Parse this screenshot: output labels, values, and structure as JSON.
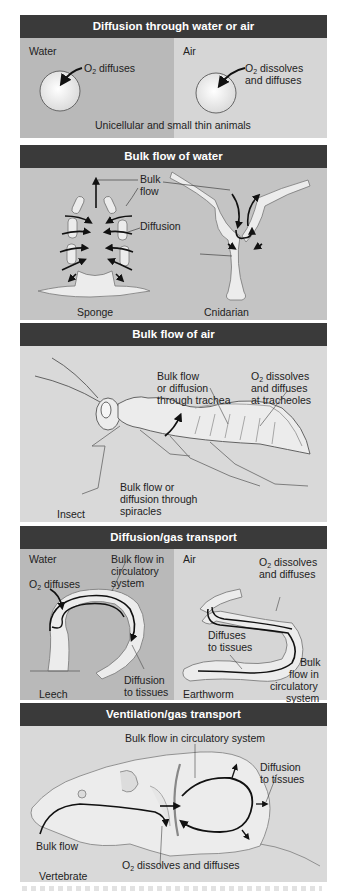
{
  "figure": {
    "panels": [
      {
        "title": "Diffusion through water or air",
        "left_label": "Water",
        "right_label": "Air",
        "left_annotation": {
          "prefix": "O",
          "sub": "2",
          "suffix": " diffuses"
        },
        "right_annotation": {
          "prefix": "O",
          "sub": "2",
          "line1_suffix": " dissolves",
          "line2": "and diffuses"
        },
        "caption": "Unicellular and small thin animals"
      },
      {
        "title": "Bulk flow of water",
        "labels": {
          "bulk_flow_1": "Bulk",
          "bulk_flow_2": "flow",
          "diffusion": "Diffusion"
        },
        "organisms": [
          "Sponge",
          "Cnidarian"
        ]
      },
      {
        "title": "Bulk flow of air",
        "labels": {
          "trachea": [
            "Bulk flow",
            "or diffusion",
            "through trachea"
          ],
          "tracheoles": {
            "prefix": "O",
            "sub": "2",
            "line1_suffix": " dissolves",
            "line2": "and diffuses",
            "line3": "at tracheoles"
          },
          "spiracles": [
            "Bulk flow or",
            "diffusion through",
            "spiracles"
          ]
        },
        "organism": "Insect"
      },
      {
        "title": "Diffusion/gas transport",
        "left_label": "Water",
        "right_label": "Air",
        "left_labels": {
          "o2": {
            "prefix": "O",
            "sub": "2",
            "suffix": " diffuses"
          },
          "bulk": [
            "Bulk flow in",
            "circulatory",
            "system"
          ],
          "diffusion": [
            "Diffusion",
            "to tissues"
          ]
        },
        "right_labels": {
          "o2": {
            "prefix": "O",
            "sub": "2",
            "line1_suffix": " dissolves",
            "line2": "and diffuses"
          },
          "diffuses": [
            "Diffuses",
            "to tissues"
          ],
          "bulk": [
            "Bulk",
            "flow in",
            "circulatory",
            "system"
          ]
        },
        "organisms": [
          "Leech",
          "Earthworm"
        ]
      },
      {
        "title": "Ventilation/gas transport",
        "labels": {
          "circulatory": "Bulk flow in circulatory system",
          "diffusion": [
            "Diffusion",
            "to tissues"
          ],
          "bulk_flow": "Bulk flow",
          "o2": {
            "prefix": "O",
            "sub": "2",
            "suffix": " dissolves and diffuses"
          }
        },
        "organism": "Vertebrate"
      }
    ],
    "colors": {
      "header": "#3a3a3a",
      "water_bg": "#b9b9b9",
      "air_bg": "#d6d6d6",
      "panel_bg": "#c4c4c4",
      "light_panel_bg": "#d9d9d9",
      "organism_fill": "#ececec",
      "arrow": "#111111"
    }
  }
}
